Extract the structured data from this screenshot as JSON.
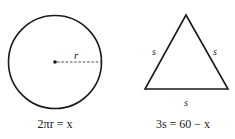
{
  "circle": {
    "radius_label": "r",
    "equation": "2πr = x"
  },
  "triangle": {
    "side_labels": [
      "s",
      "s",
      "s"
    ],
    "equation": "3s = 60 − x"
  },
  "colors": {
    "stroke": "#1a1a1a",
    "background": "#ffffff"
  }
}
